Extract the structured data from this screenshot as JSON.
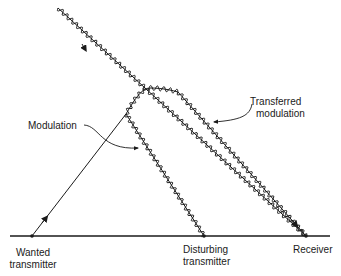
{
  "diagram": {
    "type": "propagation-interference",
    "labels": {
      "wanted_transmitter_line1": "Wanted",
      "wanted_transmitter_line2": "transmitter",
      "disturbing_transmitter_line1": "Disturbing",
      "disturbing_transmitter_line2": "transmitter",
      "receiver": "Receiver",
      "modulation": "Modulation",
      "transferred_modulation_line1": "Transferred",
      "transferred_modulation_line2": "modulation"
    },
    "colors": {
      "line": "#1a1a1a",
      "background": "#ffffff"
    }
  }
}
